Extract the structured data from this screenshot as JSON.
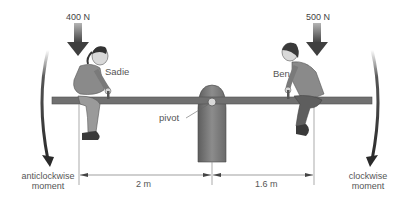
{
  "diagram": {
    "type": "seesaw-moments",
    "left_person": {
      "name": "Sadie",
      "force_label": "400 N",
      "distance_label": "2 m"
    },
    "right_person": {
      "name": "Ben",
      "force_label": "500 N",
      "distance_label": "1.6 m"
    },
    "pivot_label": "pivot",
    "left_moment": {
      "line1": "anticlockwise",
      "line2": "moment"
    },
    "right_moment": {
      "line1": "clockwise",
      "line2": "moment"
    },
    "colors": {
      "beam": "#6e6e6e",
      "pivot": "#7a7a7a",
      "arrow": "#4a4a4a",
      "person_body": "#8a8a8a",
      "person_dark": "#555555",
      "text": "#555555",
      "dimension_line": "#777777"
    }
  }
}
